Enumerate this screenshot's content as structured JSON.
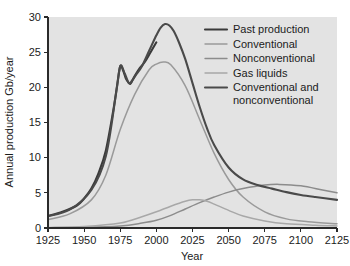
{
  "chart_data": {
    "type": "line",
    "title": "",
    "xlabel": "Year",
    "ylabel": "Annual production Gb/year",
    "xlim": [
      1925,
      2125
    ],
    "ylim": [
      0,
      30
    ],
    "xticks": [
      1925,
      1950,
      1975,
      2000,
      2025,
      2050,
      2075,
      2100,
      2125
    ],
    "yticks": [
      0,
      5,
      10,
      15,
      20,
      25,
      30
    ],
    "grid": false,
    "legend_position": "top-right",
    "colors": {
      "past_production": "#3a3a3a",
      "conventional": "#9a9a9a",
      "nonconventional": "#8c8c8c",
      "gas_liquids": "#a8a8a8",
      "conventional_and_nonconventional": "#4a4a4a",
      "plot_background": "#e3e3e3",
      "axis": "#2a2a2a",
      "text": "#1b1b1b"
    },
    "series": [
      {
        "name": "Past production",
        "color": "#3a3a3a",
        "width": 2.1,
        "x": [
          1925,
          1935,
          1945,
          1950,
          1955,
          1960,
          1965,
          1970,
          1973,
          1975,
          1977,
          1979,
          1981,
          1982,
          1983,
          1985,
          1988,
          1992,
          1996,
          2000
        ],
        "values": [
          1.7,
          2.3,
          3.2,
          4.2,
          5.6,
          7.8,
          11.0,
          16.5,
          20.5,
          23.0,
          22.4,
          21.2,
          20.6,
          20.5,
          20.8,
          21.6,
          22.6,
          23.6,
          25.0,
          26.4
        ]
      },
      {
        "name": "Conventional",
        "color": "#9a9a9a",
        "width": 1.5,
        "x": [
          1925,
          1940,
          1955,
          1965,
          1975,
          1985,
          1995,
          2000,
          2005,
          2010,
          2020,
          2030,
          2040,
          2050,
          2060,
          2075,
          2090,
          2105,
          2125
        ],
        "values": [
          1.2,
          2.0,
          4.0,
          7.5,
          14.0,
          19.0,
          22.5,
          23.3,
          23.6,
          23.2,
          20.2,
          15.4,
          10.6,
          6.9,
          4.4,
          2.3,
          1.3,
          0.9,
          0.6
        ]
      },
      {
        "name": "Nonconventional",
        "color": "#8c8c8c",
        "width": 1.5,
        "x": [
          1925,
          1950,
          1975,
          1990,
          2000,
          2010,
          2020,
          2030,
          2040,
          2050,
          2060,
          2075,
          2085,
          2100,
          2115,
          2125
        ],
        "values": [
          0.05,
          0.1,
          0.3,
          0.7,
          1.1,
          1.8,
          2.7,
          3.6,
          4.4,
          5.1,
          5.6,
          6.1,
          6.2,
          6.0,
          5.4,
          5.0
        ]
      },
      {
        "name": "Gas liquids",
        "color": "#a8a8a8",
        "width": 1.5,
        "x": [
          1925,
          1950,
          1975,
          1990,
          2000,
          2010,
          2020,
          2025,
          2030,
          2035,
          2040,
          2050,
          2060,
          2075,
          2090,
          2110,
          2125
        ],
        "values": [
          0.05,
          0.2,
          0.7,
          1.6,
          2.3,
          3.1,
          3.8,
          4.0,
          4.0,
          3.8,
          3.4,
          2.5,
          1.7,
          1.0,
          0.6,
          0.4,
          0.3
        ]
      },
      {
        "name": "Conventional and nonconventional",
        "color": "#4a4a4a",
        "width": 2.1,
        "x": [
          1925,
          1940,
          1955,
          1965,
          1972,
          1975,
          1978,
          1981,
          1983,
          1986,
          1990,
          1995,
          2000,
          2003,
          2006,
          2009,
          2012,
          2016,
          2020,
          2025,
          2030,
          2035,
          2040,
          2050,
          2060,
          2070,
          2080,
          2090,
          2100,
          2110,
          2125
        ],
        "values": [
          1.7,
          2.6,
          5.4,
          10.2,
          19.0,
          23.0,
          22.0,
          20.6,
          20.9,
          21.8,
          23.0,
          25.2,
          27.4,
          28.5,
          29.0,
          28.8,
          28.0,
          26.2,
          24.0,
          20.6,
          17.2,
          14.2,
          11.8,
          8.6,
          6.9,
          6.1,
          5.6,
          5.1,
          4.7,
          4.4,
          4.0
        ]
      }
    ],
    "legend": [
      {
        "label": "Past production",
        "color": "#3a3a3a",
        "width": 2.1
      },
      {
        "label": "Conventional",
        "color": "#9a9a9a",
        "width": 1.4
      },
      {
        "label": "Nonconventional",
        "color": "#8c8c8c",
        "width": 1.4
      },
      {
        "label": "Gas liquids",
        "color": "#a8a8a8",
        "width": 1.4
      },
      {
        "label": "Conventional and",
        "label2": "nonconventional",
        "color": "#4a4a4a",
        "width": 2.1
      }
    ]
  }
}
